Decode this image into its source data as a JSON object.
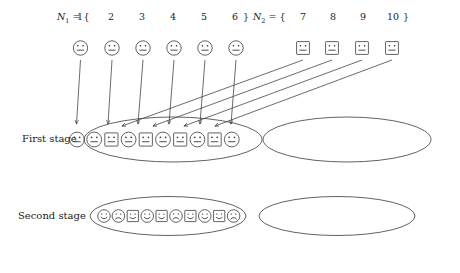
{
  "figure": {
    "title_present": false,
    "background_color": "#ffffff",
    "stroke_color": "#3a3a3a",
    "text_color": "#1a1a1a"
  },
  "sets": {
    "first": {
      "name": "N",
      "subscript": "1",
      "equals": "=",
      "open": "{",
      "close": "}",
      "elements": [
        "1",
        "2",
        "3",
        "4",
        "5",
        "6"
      ]
    },
    "second": {
      "name": "N",
      "subscript": "2",
      "equals": "=",
      "open": "{",
      "close": "}",
      "elements": [
        "7",
        "8",
        "9",
        "10"
      ]
    }
  },
  "row_labels": {
    "first_stage": "First stage",
    "second_stage": "Second stage"
  },
  "top_tokens": [
    {
      "shape": "circle",
      "mouth": "neutral",
      "set": "N1",
      "label": "1"
    },
    {
      "shape": "circle",
      "mouth": "neutral",
      "set": "N1",
      "label": "2"
    },
    {
      "shape": "circle",
      "mouth": "neutral",
      "set": "N1",
      "label": "3"
    },
    {
      "shape": "circle",
      "mouth": "neutral",
      "set": "N1",
      "label": "4"
    },
    {
      "shape": "circle",
      "mouth": "neutral",
      "set": "N1",
      "label": "5"
    },
    {
      "shape": "circle",
      "mouth": "neutral",
      "set": "N1",
      "label": "6"
    },
    {
      "shape": "square",
      "mouth": "neutral",
      "set": "N2",
      "label": "7"
    },
    {
      "shape": "square",
      "mouth": "neutral",
      "set": "N2",
      "label": "8"
    },
    {
      "shape": "square",
      "mouth": "neutral",
      "set": "N2",
      "label": "9"
    },
    {
      "shape": "square",
      "mouth": "neutral",
      "set": "N2",
      "label": "10"
    }
  ],
  "first_stage": {
    "left_group_tokens": [
      {
        "shape": "circle",
        "mouth": "neutral"
      },
      {
        "shape": "circle",
        "mouth": "neutral"
      },
      {
        "shape": "square",
        "mouth": "neutral"
      },
      {
        "shape": "circle",
        "mouth": "neutral"
      },
      {
        "shape": "square",
        "mouth": "neutral"
      },
      {
        "shape": "circle",
        "mouth": "neutral"
      },
      {
        "shape": "square",
        "mouth": "neutral"
      },
      {
        "shape": "circle",
        "mouth": "neutral"
      },
      {
        "shape": "square",
        "mouth": "neutral"
      },
      {
        "shape": "circle",
        "mouth": "neutral"
      }
    ],
    "right_group_tokens": []
  },
  "second_stage": {
    "left_group_tokens": [
      {
        "shape": "circle",
        "mouth": "smile"
      },
      {
        "shape": "circle",
        "mouth": "frown"
      },
      {
        "shape": "square",
        "mouth": "smile"
      },
      {
        "shape": "circle",
        "mouth": "smile"
      },
      {
        "shape": "square",
        "mouth": "smile"
      },
      {
        "shape": "circle",
        "mouth": "frown"
      },
      {
        "shape": "square",
        "mouth": "smile"
      },
      {
        "shape": "circle",
        "mouth": "smile"
      },
      {
        "shape": "square",
        "mouth": "smile"
      },
      {
        "shape": "circle",
        "mouth": "frown"
      }
    ],
    "right_group_tokens": []
  },
  "arrows": {
    "count": 10,
    "description": "Each element of N1 and N2 is mapped by an arrow into the left group of the first stage",
    "mapping": [
      {
        "from": "1",
        "to_slot": 1
      },
      {
        "from": "2",
        "to_slot": 2
      },
      {
        "from": "3",
        "to_slot": 4
      },
      {
        "from": "4",
        "to_slot": 6
      },
      {
        "from": "5",
        "to_slot": 8
      },
      {
        "from": "6",
        "to_slot": 10
      },
      {
        "from": "7",
        "to_slot": 3
      },
      {
        "from": "8",
        "to_slot": 5
      },
      {
        "from": "9",
        "to_slot": 7
      },
      {
        "from": "10",
        "to_slot": 9
      }
    ]
  }
}
